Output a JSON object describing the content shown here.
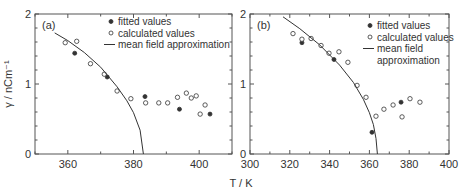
{
  "chart_data": [
    {
      "type": "scatter",
      "panel_label": "(a)",
      "xlabel": "T / K",
      "ylabel": "γ / nCm⁻¹",
      "xlim": [
        350,
        410
      ],
      "ylim": [
        0,
        2
      ],
      "xticks": [
        360,
        380,
        400
      ],
      "yticks": [
        0,
        1,
        2
      ],
      "grid": false,
      "legend": [
        "fitted values",
        "calculated values",
        "mean field approximation"
      ],
      "legend_position": "upper right",
      "series": [
        {
          "name": "fitted values",
          "marker": "filled-circle",
          "points": [
            [
              362.1,
              1.44
            ],
            [
              372.0,
              1.1
            ],
            [
              383.5,
              0.82
            ],
            [
              394.0,
              0.64
            ],
            [
              403.3,
              0.57
            ]
          ]
        },
        {
          "name": "calculated values",
          "marker": "open-circle",
          "points": [
            [
              359.2,
              1.59
            ],
            [
              362.7,
              1.61
            ],
            [
              366.9,
              1.29
            ],
            [
              371.1,
              1.14
            ],
            [
              375.0,
              0.9
            ],
            [
              379.2,
              0.79
            ],
            [
              383.7,
              0.73
            ],
            [
              387.7,
              0.73
            ],
            [
              390.4,
              0.73
            ],
            [
              393.4,
              0.81
            ],
            [
              396.1,
              0.87
            ],
            [
              397.6,
              0.8
            ],
            [
              399.1,
              0.83
            ],
            [
              400.3,
              0.57
            ],
            [
              401.8,
              0.7
            ]
          ]
        },
        {
          "name": "mean field approximation",
          "marker": "line",
          "Tc": 383,
          "points": [
            [
              356,
              1.73
            ],
            [
              360,
              1.62
            ],
            [
              365,
              1.45
            ],
            [
              370,
              1.24
            ],
            [
              375,
              0.96
            ],
            [
              378,
              0.76
            ],
            [
              380,
              0.59
            ],
            [
              382,
              0.34
            ],
            [
              383,
              0
            ]
          ]
        }
      ]
    },
    {
      "type": "scatter",
      "panel_label": "(b)",
      "xlabel": "T / K",
      "ylabel": "",
      "xlim": [
        300,
        400
      ],
      "ylim": [
        0,
        2
      ],
      "xticks": [
        300,
        320,
        340,
        360,
        380,
        400
      ],
      "yticks": [
        0,
        1,
        2
      ],
      "grid": false,
      "legend": [
        "fitted values",
        "calculated values",
        "mean field approximation"
      ],
      "legend_position": "upper right",
      "series": [
        {
          "name": "fitted values",
          "marker": "filled-circle",
          "points": [
            [
              326.1,
              1.59
            ],
            [
              342.2,
              1.35
            ],
            [
              361.3,
              0.31
            ],
            [
              375.9,
              0.74
            ]
          ]
        },
        {
          "name": "calculated values",
          "marker": "open-circle",
          "points": [
            [
              321.6,
              1.72
            ],
            [
              326.1,
              1.64
            ],
            [
              330.7,
              1.65
            ],
            [
              335.7,
              1.55
            ],
            [
              339.7,
              1.44
            ],
            [
              344.7,
              1.46
            ],
            [
              349.2,
              1.31
            ],
            [
              353.8,
              0.98
            ],
            [
              358.3,
              0.81
            ],
            [
              363.3,
              0.54
            ],
            [
              367.3,
              0.64
            ],
            [
              371.9,
              0.7
            ],
            [
              376.4,
              0.53
            ],
            [
              380.4,
              0.79
            ],
            [
              385.4,
              0.74
            ]
          ]
        },
        {
          "name": "mean field approximation",
          "marker": "line",
          "Tc": 364,
          "points": [
            [
              316.6,
              1.96
            ],
            [
              325,
              1.79
            ],
            [
              335,
              1.56
            ],
            [
              345,
              1.27
            ],
            [
              352,
              1.02
            ],
            [
              357,
              0.78
            ],
            [
              360,
              0.59
            ],
            [
              362,
              0.42
            ],
            [
              363.3,
              0.22
            ],
            [
              364,
              0
            ]
          ]
        }
      ]
    }
  ],
  "labels": {
    "panel_a": "(a)",
    "panel_b": "(b)",
    "y_axis_title": "γ / nCm⁻¹",
    "x_axis_title": "T / K",
    "legend_a": [
      "fitted values",
      "calculated values",
      "mean field approximation"
    ],
    "legend_b": [
      "fitted values",
      "calculated values",
      "mean field",
      "approximation"
    ]
  },
  "colors": {
    "ink": "#333333",
    "axis": "#555555",
    "background": "#ffffff"
  }
}
